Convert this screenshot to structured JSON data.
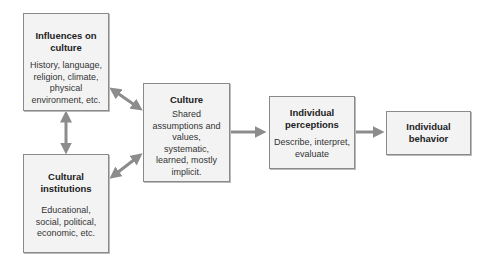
{
  "diagram": {
    "boxes": [
      {
        "id": "influences",
        "title": "Influences on culture",
        "body": "History, language, religion, climate, physical environment, etc."
      },
      {
        "id": "institutions",
        "title": "Cultural institutions",
        "body": "Educational, social, political, economic, etc."
      },
      {
        "id": "culture",
        "title": "Culture",
        "body": "Shared assumptions and values, systematic, learned, mostly implicit."
      },
      {
        "id": "perceptions",
        "title": "Individual perceptions",
        "body": "Describe, interpret, evaluate"
      },
      {
        "id": "behavior",
        "title": "Individual behavior",
        "body": ""
      }
    ],
    "arrows": [
      {
        "from": "influences",
        "to": "institutions",
        "type": "bidirectional"
      },
      {
        "from": "influences",
        "to": "culture",
        "type": "bidirectional"
      },
      {
        "from": "institutions",
        "to": "culture",
        "type": "bidirectional"
      },
      {
        "from": "culture",
        "to": "perceptions",
        "type": "directed"
      },
      {
        "from": "perceptions",
        "to": "behavior",
        "type": "directed"
      }
    ],
    "colors": {
      "box_fill": "#f3f3f3",
      "box_border": "#8a8a8a",
      "arrow": "#8c8c8c"
    }
  }
}
